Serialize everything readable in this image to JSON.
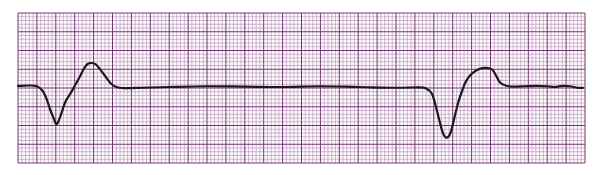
{
  "chart_data": {
    "type": "line",
    "title": "",
    "subtitle": "",
    "xlabel": "",
    "ylabel": "",
    "grid": {
      "on": true,
      "minor_cells_x": 150,
      "minor_cells_y": 40,
      "major_every": 5,
      "minor_color": "#b48cb4",
      "major_color": "#6e3a6e",
      "background": "#fdf9fd"
    },
    "trace_color": "#1a1a1a",
    "units": "grid minor cells (x from left, y positive up from baseline)",
    "x_range": [
      0,
      150
    ],
    "y_range": [
      -20,
      20
    ],
    "series": [
      {
        "name": "ECG trace",
        "points": [
          [
            0,
            0.3
          ],
          [
            3,
            0.4
          ],
          [
            5,
            0.2
          ],
          [
            6.5,
            -1
          ],
          [
            7.5,
            -3
          ],
          [
            8.5,
            -6
          ],
          [
            9.5,
            -8.5
          ],
          [
            10,
            -9.8
          ],
          [
            10.5,
            -9.6
          ],
          [
            11.5,
            -7
          ],
          [
            12.5,
            -4
          ],
          [
            14,
            -1.5
          ],
          [
            15,
            0.3
          ],
          [
            16.5,
            3
          ],
          [
            17.5,
            5
          ],
          [
            18.5,
            6.2
          ],
          [
            19.5,
            6.4
          ],
          [
            20.5,
            6.1
          ],
          [
            21.5,
            5
          ],
          [
            23,
            3
          ],
          [
            24.5,
            1
          ],
          [
            26,
            0
          ],
          [
            28,
            -0.3
          ],
          [
            33,
            -0.2
          ],
          [
            40,
            0
          ],
          [
            50,
            0.2
          ],
          [
            60,
            0.1
          ],
          [
            70,
            0
          ],
          [
            80,
            0.2
          ],
          [
            90,
            0
          ],
          [
            100,
            -0.2
          ],
          [
            106,
            -0.1
          ],
          [
            108,
            -0.4
          ],
          [
            109.5,
            -1.8
          ],
          [
            110.5,
            -5
          ],
          [
            111.5,
            -9
          ],
          [
            112.5,
            -12.5
          ],
          [
            113.5,
            -13.5
          ],
          [
            114.5,
            -12
          ],
          [
            115.5,
            -8
          ],
          [
            116.5,
            -4
          ],
          [
            117.5,
            -1
          ],
          [
            118.5,
            1.5
          ],
          [
            120,
            3.5
          ],
          [
            122,
            4.8
          ],
          [
            124,
            5.1
          ],
          [
            125.5,
            4.6
          ],
          [
            126.5,
            3
          ],
          [
            127.5,
            1.2
          ],
          [
            129,
            0.4
          ],
          [
            131,
            0.1
          ],
          [
            134,
            0.2
          ],
          [
            137,
            0.3
          ],
          [
            140,
            0.2
          ],
          [
            142,
            0
          ],
          [
            144,
            0.3
          ],
          [
            146,
            0.2
          ],
          [
            148,
            -0.2
          ],
          [
            149.5,
            -0.2
          ]
        ]
      }
    ],
    "annotations": [
      {
        "label": "complex-1",
        "x_center": 14,
        "trough_y": -9.8,
        "peak_y": 6.4
      },
      {
        "label": "complex-2",
        "x_center": 117,
        "trough_y": -13.5,
        "peak_y": 5.1
      }
    ]
  }
}
